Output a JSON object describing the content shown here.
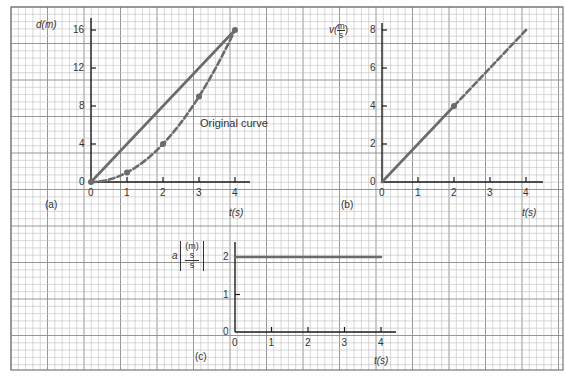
{
  "colors": {
    "grid_minor": "#bdbdbd",
    "grid_major": "#8a8a8a",
    "axis": "#1a1a1a",
    "curve": "#6b6b6b",
    "text": "#333333"
  },
  "panels": {
    "a": {
      "tag": "(a)",
      "y_label": "d(m)",
      "x_label": "t(s)",
      "annotation": "Original curve",
      "y_ticks": [
        "0",
        "4",
        "8",
        "12",
        "16"
      ],
      "x_ticks": [
        "0",
        "1",
        "2",
        "3",
        "4"
      ]
    },
    "b": {
      "tag": "(b)",
      "y_label_prefix": "v(",
      "y_label_num": "m",
      "y_label_den": "s",
      "y_label_suffix": ")",
      "x_label": "t(s)",
      "y_ticks": [
        "0",
        "2",
        "4",
        "6",
        "8"
      ],
      "x_ticks": [
        "0",
        "1",
        "2",
        "3",
        "4"
      ]
    },
    "c": {
      "tag": "(c)",
      "y_label_prefix": "a",
      "y_label_num": "m",
      "y_label_mid": "s",
      "y_label_den": "s",
      "x_label": "t(s)",
      "y_ticks": [
        "0",
        "1",
        "2"
      ],
      "x_ticks": [
        "0",
        "1",
        "2",
        "3",
        "4"
      ]
    }
  },
  "chart_data": [
    {
      "type": "line",
      "title": "(a)",
      "xlabel": "t(s)",
      "ylabel": "d(m)",
      "xlim": [
        0,
        4.3
      ],
      "ylim": [
        0,
        17
      ],
      "grid": true,
      "annotations": [
        "Original curve"
      ],
      "series": [
        {
          "name": "Original curve",
          "style": "dashed",
          "x": [
            0,
            1,
            2,
            3,
            4
          ],
          "y": [
            0,
            1,
            4,
            9,
            16
          ],
          "markers": true
        },
        {
          "name": "Secant line",
          "style": "solid",
          "x": [
            0,
            4
          ],
          "y": [
            0,
            16
          ]
        }
      ]
    },
    {
      "type": "line",
      "title": "(b)",
      "xlabel": "t(s)",
      "ylabel": "v(m/s)",
      "xlim": [
        0,
        4.4
      ],
      "ylim": [
        0,
        8.5
      ],
      "grid": true,
      "series": [
        {
          "name": "velocity (solid)",
          "style": "solid",
          "x": [
            0,
            2
          ],
          "y": [
            0,
            4
          ]
        },
        {
          "name": "velocity (dashed)",
          "style": "dashed",
          "x": [
            2,
            4
          ],
          "y": [
            4,
            8
          ]
        }
      ],
      "points": [
        {
          "x": 2,
          "y": 4
        }
      ]
    },
    {
      "type": "line",
      "title": "(c)",
      "xlabel": "t(s)",
      "ylabel": "a[(m/s)/s]",
      "xlim": [
        0,
        4.4
      ],
      "ylim": [
        0,
        2.5
      ],
      "grid": true,
      "series": [
        {
          "name": "acceleration",
          "style": "solid",
          "x": [
            0,
            4
          ],
          "y": [
            2,
            2
          ]
        }
      ]
    }
  ]
}
